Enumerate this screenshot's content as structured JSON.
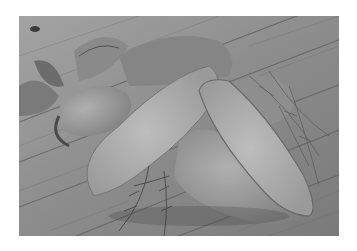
{
  "image": {
    "subject": "Sweet potatoes on rustic wooden table",
    "description": "Grayscale photograph of whole and halved sweet potatoes with sprigs of rosemary and thyme on weathered wooden planks",
    "color_mode": "grayscale",
    "elements": [
      "halved-sweet-potato",
      "halved-sweet-potato",
      "whole-sweet-potato",
      "whole-sweet-potato",
      "rosemary-sprigs",
      "thyme-sprigs",
      "leafy-greens",
      "wooden-planks"
    ]
  },
  "colors": {
    "background": "#ffffff",
    "wood_light": "#a8a8a8",
    "wood_dark": "#5a5a5a",
    "potato_flesh": "#b4b4b4",
    "potato_skin": "#9c9c9c",
    "shadow": "#3a3a3a"
  }
}
